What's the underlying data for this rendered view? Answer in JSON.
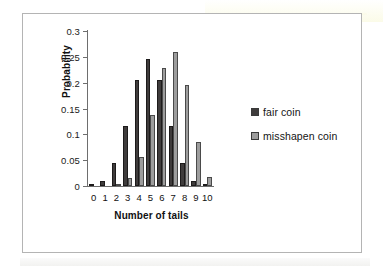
{
  "chart_data": {
    "type": "bar",
    "title": "",
    "xlabel": "Number of tails",
    "ylabel": "Probability",
    "categories": [
      "0",
      "1",
      "2",
      "3",
      "4",
      "5",
      "6",
      "7",
      "8",
      "9",
      "10"
    ],
    "ylim": [
      0,
      0.3
    ],
    "yticks": [
      "0",
      "0.05",
      "0.1",
      "0.15",
      "0.2",
      "0.25",
      "0.3"
    ],
    "ytick_values": [
      0,
      0.05,
      0.1,
      0.15,
      0.2,
      0.25,
      0.3
    ],
    "grid": false,
    "legend_position": "right",
    "series": [
      {
        "name": "fair coin",
        "color": "#3f3c3c",
        "values": [
          0.001,
          0.01,
          0.044,
          0.117,
          0.205,
          0.246,
          0.205,
          0.117,
          0.044,
          0.01,
          0.001
        ]
      },
      {
        "name": "misshapen coin",
        "color": "#9d9d9d",
        "values": [
          0.0,
          0.0,
          0.003,
          0.016,
          0.056,
          0.137,
          0.228,
          0.26,
          0.195,
          0.086,
          0.017
        ]
      }
    ]
  },
  "legend": {
    "items": [
      {
        "label": "fair coin",
        "swatch": "fair"
      },
      {
        "label": "misshapen coin",
        "swatch": "miss"
      }
    ]
  },
  "colors": {
    "fair_coin": "#3f3c3c",
    "misshapen_coin": "#9d9d9d",
    "axis": "#6e6e6e",
    "frame_border": "#b4b4b4",
    "text": "#111111"
  }
}
